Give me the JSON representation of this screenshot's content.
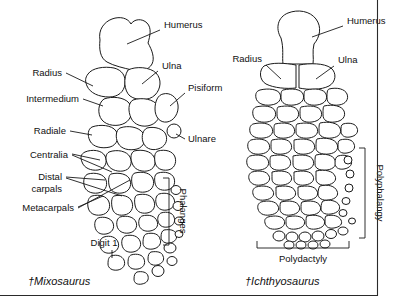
{
  "figure": {
    "background_color": "#ffffff",
    "line_color": "#1a1a1a",
    "border": {
      "vertical_rule": true,
      "horizontal_rule": true
    }
  },
  "specimens": [
    {
      "id": "mixosaurus",
      "caption": "†Mixosaurus",
      "labels": [
        {
          "name": "humerus",
          "text": "Humerus"
        },
        {
          "name": "radius",
          "text": "Radius"
        },
        {
          "name": "ulna",
          "text": "Ulna"
        },
        {
          "name": "intermedium",
          "text": "Intermedium"
        },
        {
          "name": "pisiform",
          "text": "Pisiform"
        },
        {
          "name": "radiale",
          "text": "Radiale"
        },
        {
          "name": "ulnare",
          "text": "Ulnare"
        },
        {
          "name": "centralia",
          "text": "Centralia"
        },
        {
          "name": "distal-carpals",
          "text": "Distal"
        },
        {
          "name": "distal-carpals-2",
          "text": "carpals"
        },
        {
          "name": "metacarpals",
          "text": "Metacarpals"
        },
        {
          "name": "digit-1",
          "text": "Digit 1"
        }
      ],
      "brackets": [
        {
          "name": "phalanges",
          "text": "Phalanges",
          "orientation": "vertical"
        }
      ]
    },
    {
      "id": "ichthyosaurus",
      "caption": "†Ichthyosaurus",
      "labels": [
        {
          "name": "humerus",
          "text": "Humerus"
        },
        {
          "name": "radius",
          "text": "Radius"
        },
        {
          "name": "ulna",
          "text": "Ulna"
        }
      ],
      "brackets": [
        {
          "name": "polyphalangy",
          "text": "Polyphalangy",
          "orientation": "vertical"
        },
        {
          "name": "polydactyly",
          "text": "Polydactyly",
          "orientation": "horizontal"
        }
      ]
    }
  ]
}
